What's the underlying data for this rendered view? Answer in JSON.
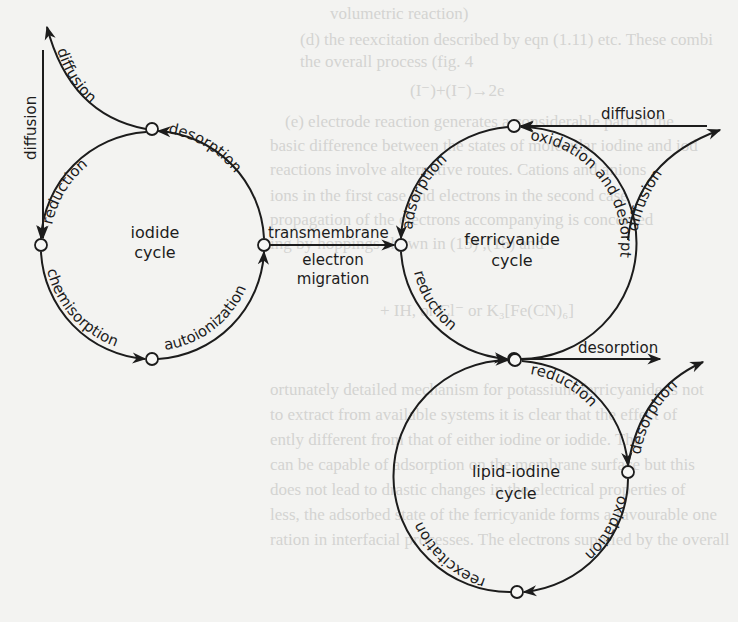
{
  "figure": {
    "type": "cycle-diagram",
    "colors": {
      "ink": "#1c1c1c",
      "paper": "#f3f3f1",
      "bleed_text": "#d4d4d2"
    },
    "cycles": [
      {
        "id": "iodide",
        "title_line1": "iodide",
        "title_line2": "cycle"
      },
      {
        "id": "ferricyanide",
        "title_line1": "ferricyanide",
        "title_line2": "cycle"
      },
      {
        "id": "lipid_iodine",
        "title_line1": "lipid-iodine",
        "title_line2": "cycle"
      }
    ],
    "iodide_cycle": {
      "desorption": "desorption",
      "reduction": "reduction",
      "chemisorption": "chemisorption",
      "autoionization": "autoionization",
      "diffusion_out": "diffusion",
      "diffusion_in": "diffusion"
    },
    "link": {
      "top": "transmembrane",
      "bottom_line1": "electron",
      "bottom_line2": "migration"
    },
    "ferricyanide_cycle": {
      "adsorption": "adsorption",
      "oxidation_and_desorption": "oxidation and desorption",
      "reduction": "reduction",
      "diffusion_in": "diffusion",
      "diffusion_out": "diffusion",
      "desorption_out": "desorption"
    },
    "lipid_iodine_cycle": {
      "reduction": "reduction",
      "oxidation": "oxidation",
      "reexcitation": "reexcitation",
      "desorption_out": "desorption"
    }
  },
  "bleed_through": [
    "volumetric reaction)",
    "(d) the reexcitation described by eqn (1.11) etc. These combi",
    "the overall process (fig. 4",
    "(I⁻)+(I⁻)→2e",
    "(e) electrode reaction generates a considerable part of the",
    "basic difference between the states of molecular iodine and iod",
    "reactions involve alternative routes. Cations and anions",
    "ions in the first case and electrons in the second case",
    "propagation of the electrons accompanying is concerned",
    "ing by hoppings shown in (15) ,(16) and",
    "+ IH, or Cl⁻ or  K₃[Fe(CN)₆]",
    "ortunately detailed mechanism for potassium ferricyanide is not",
    "to extract from available systems it is clear that the effect of",
    "ently different from that of either iodine or iodide. The",
    "can be capable of adsorption on the membrane surface but this",
    "does not lead to drastic changes in the electrical properties of",
    "less, the adsorbed state of the ferricyanide forms a favourable one",
    "ration in interfacial processes. The electrons supplied by the overall"
  ]
}
